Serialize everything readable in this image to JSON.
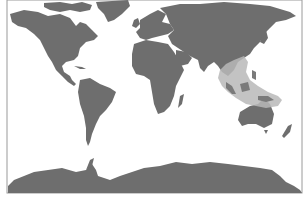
{
  "map": {
    "type": "world distribution map",
    "projection": "equirectangular-like",
    "colors": {
      "water": "#ffffff",
      "land": "#6e6e6e",
      "range": "#b8b8b8",
      "frame": "#9a9a9a"
    },
    "highlighted_region": {
      "name": "distribution-range",
      "area": "Southeast Asia to New Guinea",
      "description": "Shaded band from southern China through Indochina, the Malay Archipelago and the Philippines to New Guinea"
    },
    "landmasses": [
      "North America",
      "Greenland",
      "South America",
      "Europe",
      "Africa",
      "Asia",
      "Madagascar",
      "Australia",
      "New Zealand",
      "Antarctica"
    ]
  }
}
